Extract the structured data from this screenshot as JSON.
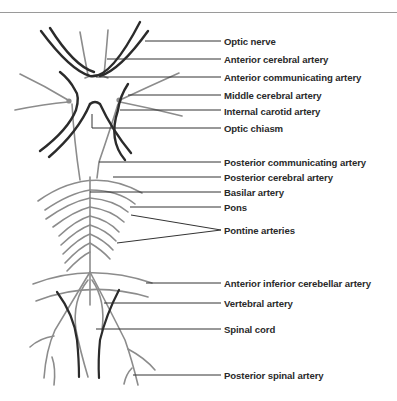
{
  "diagram": {
    "type": "anatomical-diagram",
    "colors": {
      "background": "#ffffff",
      "dark_vessel": "#2b2b2b",
      "gray_vessel": "#8c8c8c",
      "leader_line": "#333333",
      "label_text": "#2a2a2a",
      "top_rule": "#9a9a9a"
    },
    "labels": [
      {
        "id": "optic-nerve",
        "text": "Optic nerve",
        "y": 41
      },
      {
        "id": "anterior-cerebral-artery",
        "text": "Anterior cerebral artery",
        "y": 59
      },
      {
        "id": "anterior-communicating-artery",
        "text": "Anterior communicating artery",
        "y": 77
      },
      {
        "id": "middle-cerebral-artery",
        "text": "Middle cerebral artery",
        "y": 95
      },
      {
        "id": "internal-carotid-artery",
        "text": "Internal carotid artery",
        "y": 111
      },
      {
        "id": "optic-chiasm",
        "text": "Optic chiasm",
        "y": 128
      },
      {
        "id": "posterior-communicating-artery",
        "text": "Posterior communicating artery",
        "y": 162
      },
      {
        "id": "posterior-cerebral-artery",
        "text": "Posterior cerebral artery",
        "y": 177
      },
      {
        "id": "basilar-artery",
        "text": "Basilar artery",
        "y": 192
      },
      {
        "id": "pons",
        "text": "Pons",
        "y": 207
      },
      {
        "id": "pontine-arteries",
        "text": "Pontine arteries",
        "y": 230
      },
      {
        "id": "anterior-inferior-cerebellar-artery",
        "text": "Anterior inferior cerebellar artery",
        "y": 283
      },
      {
        "id": "vertebral-artery",
        "text": "Vertebral artery",
        "y": 303
      },
      {
        "id": "spinal-cord",
        "text": "Spinal cord",
        "y": 329
      },
      {
        "id": "posterior-spinal-artery",
        "text": "Posterior spinal artery",
        "y": 375
      }
    ]
  }
}
